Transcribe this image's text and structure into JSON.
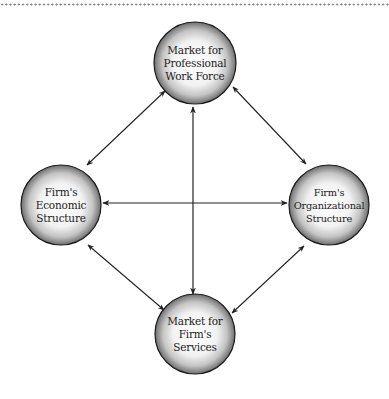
{
  "diagram": {
    "type": "relationship-network",
    "nodes": [
      {
        "id": "workforce",
        "lines": [
          "Market for",
          "Professional",
          "Work Force"
        ],
        "cx": 195,
        "cy": 63,
        "r": 41
      },
      {
        "id": "economic",
        "lines": [
          "Firm's",
          "Economic",
          "Structure"
        ],
        "cx": 61,
        "cy": 205,
        "r": 40
      },
      {
        "id": "organizational",
        "lines": [
          "Firm's",
          "Organizational",
          "Structure"
        ],
        "cx": 329,
        "cy": 205,
        "r": 40
      },
      {
        "id": "services",
        "lines": [
          "Market for",
          "Firm's",
          "Services"
        ],
        "cx": 195,
        "cy": 334,
        "r": 40
      }
    ],
    "edges": [
      {
        "from": "workforce",
        "to": "economic",
        "bidirectional": true
      },
      {
        "from": "workforce",
        "to": "organizational",
        "bidirectional": true
      },
      {
        "from": "workforce",
        "to": "services",
        "bidirectional": true
      },
      {
        "from": "economic",
        "to": "organizational",
        "bidirectional": true
      },
      {
        "from": "economic",
        "to": "services",
        "bidirectional": true
      },
      {
        "from": "organizational",
        "to": "services",
        "bidirectional": true
      }
    ],
    "colors": {
      "stroke": "#222222",
      "circle_outline": "#1a1a1a",
      "gradient_center": "#ffffff",
      "gradient_edge": "#6e6e6e",
      "dotted_rule": "#8a8a8a"
    }
  }
}
